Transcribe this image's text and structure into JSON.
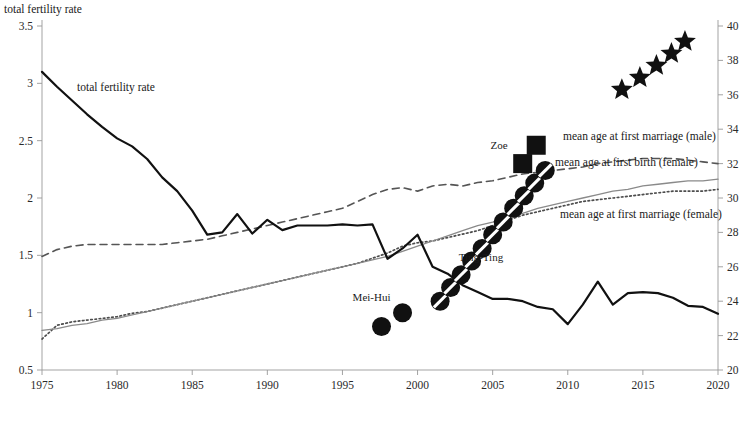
{
  "chart_data": {
    "type": "line",
    "title": "",
    "ylabel_left": "total fertility rate",
    "ylabel_right": "",
    "xlabel": "",
    "xlim": [
      1975,
      2020
    ],
    "xticks": [
      1975,
      1980,
      1985,
      1990,
      1995,
      2000,
      2005,
      2010,
      2015,
      2020
    ],
    "ylim_left": [
      0.5,
      3.5
    ],
    "yticks_left": [
      0.5,
      1,
      1.5,
      2,
      2.5,
      3,
      3.5
    ],
    "ylim_right": [
      20,
      40
    ],
    "yticks_right": [
      20,
      22,
      24,
      26,
      28,
      30,
      32,
      34,
      36,
      38,
      40
    ],
    "grid": false,
    "legend_position": "bottom",
    "series": [
      {
        "name": "mean age at first marriage (male)",
        "axis": "right",
        "style": "dashed",
        "color": "#555555",
        "x": [
          1975,
          1976,
          1977,
          1978,
          1979,
          1980,
          1981,
          1982,
          1983,
          1984,
          1985,
          1986,
          1987,
          1988,
          1989,
          1990,
          1991,
          1992,
          1993,
          1994,
          1995,
          1996,
          1997,
          1998,
          1999,
          2000,
          2001,
          2002,
          2003,
          2004,
          2005,
          2006,
          2007,
          2008,
          2009,
          2010,
          2011,
          2012,
          2013,
          2014,
          2015,
          2016,
          2017,
          2018,
          2019,
          2020
        ],
        "values": [
          26.6,
          27.0,
          27.2,
          27.3,
          27.3,
          27.3,
          27.3,
          27.3,
          27.3,
          27.4,
          27.5,
          27.6,
          27.8,
          28.0,
          28.2,
          28.4,
          28.6,
          28.8,
          29.0,
          29.2,
          29.4,
          29.8,
          30.2,
          30.5,
          30.6,
          30.4,
          30.7,
          30.8,
          30.7,
          30.9,
          31.0,
          31.2,
          31.4,
          31.5,
          31.6,
          31.7,
          31.8,
          32.0,
          32.1,
          32.2,
          32.3,
          32.3,
          32.3,
          32.2,
          32.1,
          32.0
        ]
      },
      {
        "name": "mean age at first marriage (female)",
        "axis": "right",
        "style": "dotted",
        "color": "#4d4d4d",
        "x": [
          1975,
          1976,
          1977,
          1978,
          1979,
          1980,
          1981,
          1982,
          1983,
          1984,
          1985,
          1986,
          1987,
          1988,
          1989,
          1990,
          1991,
          1992,
          1993,
          1994,
          1995,
          1996,
          1997,
          1998,
          1999,
          2000,
          2001,
          2002,
          2003,
          2004,
          2005,
          2006,
          2007,
          2008,
          2009,
          2010,
          2011,
          2012,
          2013,
          2014,
          2015,
          2016,
          2017,
          2018,
          2019,
          2020
        ],
        "values": [
          21.8,
          22.6,
          22.8,
          22.9,
          23.0,
          23.1,
          23.3,
          23.4,
          23.6,
          23.8,
          24.0,
          24.2,
          24.4,
          24.6,
          24.8,
          25.0,
          25.2,
          25.4,
          25.6,
          25.8,
          26.0,
          26.2,
          26.5,
          26.8,
          27.2,
          27.4,
          27.5,
          27.7,
          27.9,
          28.1,
          28.4,
          28.7,
          29.0,
          29.2,
          29.4,
          29.6,
          29.8,
          29.9,
          30.0,
          30.1,
          30.2,
          30.3,
          30.4,
          30.4,
          30.4,
          30.5
        ]
      },
      {
        "name": "mean age at first birth (female)",
        "axis": "right",
        "style": "solid-light",
        "color": "#8a8a8a",
        "x": [
          1975,
          1976,
          1977,
          1978,
          1979,
          1980,
          1981,
          1982,
          1983,
          1984,
          1985,
          1986,
          1987,
          1988,
          1989,
          1990,
          1991,
          1992,
          1993,
          1994,
          1995,
          1996,
          1997,
          1998,
          1999,
          2000,
          2001,
          2002,
          2003,
          2004,
          2005,
          2006,
          2007,
          2008,
          2009,
          2010,
          2011,
          2012,
          2013,
          2014,
          2015,
          2016,
          2017,
          2018,
          2019,
          2020
        ],
        "values": [
          22.3,
          22.4,
          22.6,
          22.7,
          22.9,
          23.0,
          23.2,
          23.4,
          23.6,
          23.8,
          24.0,
          24.2,
          24.4,
          24.6,
          24.8,
          25.0,
          25.2,
          25.4,
          25.6,
          25.8,
          26.0,
          26.2,
          26.4,
          26.6,
          26.9,
          27.2,
          27.5,
          27.8,
          28.1,
          28.4,
          28.6,
          28.9,
          29.1,
          29.4,
          29.6,
          29.8,
          30.0,
          30.2,
          30.4,
          30.5,
          30.7,
          30.8,
          30.9,
          31.0,
          31.0,
          31.1
        ]
      },
      {
        "name": "total fertility rate",
        "axis": "left",
        "style": "solid-bold",
        "color": "#111111",
        "x": [
          1975,
          1976,
          1977,
          1978,
          1979,
          1980,
          1981,
          1982,
          1983,
          1984,
          1985,
          1986,
          1987,
          1988,
          1989,
          1990,
          1991,
          1992,
          1993,
          1994,
          1995,
          1996,
          1997,
          1998,
          1999,
          2000,
          2001,
          2002,
          2003,
          2004,
          2005,
          2006,
          2007,
          2008,
          2009,
          2010,
          2011,
          2012,
          2013,
          2014,
          2015,
          2016,
          2017,
          2018,
          2019,
          2020
        ],
        "values": [
          3.1,
          2.97,
          2.85,
          2.73,
          2.62,
          2.52,
          2.45,
          2.34,
          2.18,
          2.06,
          1.89,
          1.68,
          1.7,
          1.86,
          1.69,
          1.81,
          1.72,
          1.76,
          1.76,
          1.76,
          1.77,
          1.76,
          1.77,
          1.47,
          1.56,
          1.68,
          1.4,
          1.34,
          1.24,
          1.18,
          1.12,
          1.12,
          1.1,
          1.05,
          1.03,
          0.9,
          1.07,
          1.27,
          1.07,
          1.17,
          1.18,
          1.17,
          1.13,
          1.06,
          1.05,
          0.99
        ]
      }
    ],
    "markers": [
      {
        "label": "Mei-Hui",
        "shape": "filled-circle",
        "label_x": 1998.2,
        "label_y": 1.1,
        "points": [
          [
            1997.6,
            0.88
          ],
          [
            1999.0,
            1.0
          ]
        ]
      },
      {
        "label": "Ting-Ting",
        "shape": "slashed-circle",
        "label_x": 2005.7,
        "label_y": 1.45,
        "points": [
          [
            2001.5,
            1.1
          ],
          [
            2002.2,
            1.22
          ],
          [
            2002.9,
            1.33
          ],
          [
            2003.6,
            1.45
          ],
          [
            2004.3,
            1.56
          ],
          [
            2005.0,
            1.68
          ],
          [
            2005.7,
            1.79
          ],
          [
            2006.4,
            1.91
          ],
          [
            2007.1,
            2.02
          ],
          [
            2007.8,
            2.13
          ],
          [
            2008.5,
            2.24
          ]
        ]
      },
      {
        "label": "Zoe",
        "shape": "filled-square",
        "label_x": 2006.0,
        "label_y": 2.43,
        "points": [
          [
            2007.0,
            2.3
          ],
          [
            2007.9,
            2.46
          ]
        ]
      },
      {
        "label": "Stella",
        "shape": "star",
        "label_x": 2013.3,
        "label_y": 3.04,
        "points": [
          [
            2013.6,
            36.3
          ],
          [
            2014.8,
            37.0
          ],
          [
            2015.9,
            37.7
          ],
          [
            2016.9,
            38.4
          ],
          [
            2017.8,
            39.1
          ]
        ],
        "axis": "right"
      }
    ],
    "inline_annotations": [
      {
        "name": "tfr-inline-label",
        "text": "total fertility rate",
        "x": 77,
        "y": 91
      },
      {
        "name": "male-marriage-inline-label",
        "text": "mean age at first marriage (male)",
        "x": 563,
        "y": 140
      },
      {
        "name": "first-birth-inline-label",
        "text": "mean age at first birth (female)",
        "x": 555,
        "y": 166
      },
      {
        "name": "female-marriage-inline-label",
        "text": "mean age at first marriage (female)",
        "x": 560,
        "y": 218
      }
    ]
  },
  "legend": {
    "items": [
      {
        "label": "mean age at first marriage (male)",
        "style": "dashed"
      },
      {
        "label": "mean age at first marriage (female)",
        "style": "dotted"
      },
      {
        "label": "mean age at first birth (female)",
        "style": "solid-light"
      },
      {
        "label": "total fertility rate",
        "style": "solid-bold"
      }
    ]
  }
}
